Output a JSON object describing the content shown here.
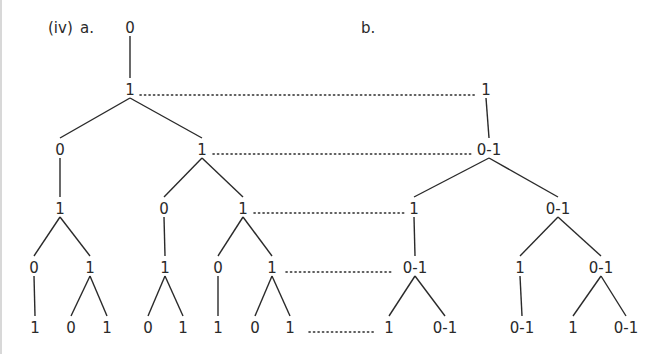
{
  "figure": {
    "label": "(iv)",
    "part_a_label": "a.",
    "part_b_label": "b."
  },
  "colors": {
    "ink": "#2a2a2a",
    "background": "#ffffff",
    "left_border": "#d8d8d8"
  },
  "tree_a": {
    "nodes": [
      {
        "id": "a0",
        "label": "0",
        "x": 130,
        "y": 28
      },
      {
        "id": "a1",
        "label": "1",
        "x": 130,
        "y": 90
      },
      {
        "id": "a2",
        "label": "0",
        "x": 60,
        "y": 150
      },
      {
        "id": "a3",
        "label": "1",
        "x": 202,
        "y": 150
      },
      {
        "id": "a4",
        "label": "1",
        "x": 60,
        "y": 209
      },
      {
        "id": "a5",
        "label": "0",
        "x": 164,
        "y": 209
      },
      {
        "id": "a6",
        "label": "1",
        "x": 243,
        "y": 209
      },
      {
        "id": "a7",
        "label": "0",
        "x": 34,
        "y": 268
      },
      {
        "id": "a8",
        "label": "1",
        "x": 90,
        "y": 268
      },
      {
        "id": "a9",
        "label": "1",
        "x": 165,
        "y": 268
      },
      {
        "id": "a10",
        "label": "0",
        "x": 218,
        "y": 268
      },
      {
        "id": "a11",
        "label": "1",
        "x": 272,
        "y": 268
      },
      {
        "id": "a12",
        "label": "1",
        "x": 35,
        "y": 328
      },
      {
        "id": "a13",
        "label": "0",
        "x": 71,
        "y": 328
      },
      {
        "id": "a14",
        "label": "1",
        "x": 107,
        "y": 328
      },
      {
        "id": "a15",
        "label": "0",
        "x": 148,
        "y": 328
      },
      {
        "id": "a16",
        "label": "1",
        "x": 183,
        "y": 328
      },
      {
        "id": "a17",
        "label": "1",
        "x": 218,
        "y": 328
      },
      {
        "id": "a18",
        "label": "0",
        "x": 255,
        "y": 328
      },
      {
        "id": "a19",
        "label": "1",
        "x": 290,
        "y": 328
      }
    ],
    "edges": [
      [
        "a0",
        "a1"
      ],
      [
        "a1",
        "a2"
      ],
      [
        "a1",
        "a3"
      ],
      [
        "a2",
        "a4"
      ],
      [
        "a3",
        "a5"
      ],
      [
        "a3",
        "a6"
      ],
      [
        "a4",
        "a7"
      ],
      [
        "a4",
        "a8"
      ],
      [
        "a5",
        "a9"
      ],
      [
        "a6",
        "a10"
      ],
      [
        "a6",
        "a11"
      ],
      [
        "a7",
        "a12"
      ],
      [
        "a8",
        "a13"
      ],
      [
        "a8",
        "a14"
      ],
      [
        "a9",
        "a15"
      ],
      [
        "a9",
        "a16"
      ],
      [
        "a10",
        "a17"
      ],
      [
        "a11",
        "a18"
      ],
      [
        "a11",
        "a19"
      ]
    ]
  },
  "tree_b": {
    "nodes": [
      {
        "id": "b0",
        "label": "1",
        "x": 486,
        "y": 90
      },
      {
        "id": "b1",
        "label": "0-1",
        "x": 489,
        "y": 150
      },
      {
        "id": "b2",
        "label": "1",
        "x": 414,
        "y": 209
      },
      {
        "id": "b3",
        "label": "0-1",
        "x": 558,
        "y": 209
      },
      {
        "id": "b4",
        "label": "0-1",
        "x": 415,
        "y": 268
      },
      {
        "id": "b5",
        "label": "1",
        "x": 520,
        "y": 268
      },
      {
        "id": "b6",
        "label": "0-1",
        "x": 601,
        "y": 268
      },
      {
        "id": "b7",
        "label": "1",
        "x": 389,
        "y": 328
      },
      {
        "id": "b8",
        "label": "0-1",
        "x": 445,
        "y": 328
      },
      {
        "id": "b9",
        "label": "0-1",
        "x": 522,
        "y": 328
      },
      {
        "id": "b10",
        "label": "1",
        "x": 573,
        "y": 328
      },
      {
        "id": "b11",
        "label": "0-1",
        "x": 626,
        "y": 328
      }
    ],
    "edges": [
      [
        "b0",
        "b1"
      ],
      [
        "b1",
        "b2"
      ],
      [
        "b1",
        "b3"
      ],
      [
        "b2",
        "b4"
      ],
      [
        "b3",
        "b5"
      ],
      [
        "b3",
        "b6"
      ],
      [
        "b4",
        "b7"
      ],
      [
        "b4",
        "b8"
      ],
      [
        "b5",
        "b9"
      ],
      [
        "b6",
        "b10"
      ],
      [
        "b6",
        "b11"
      ]
    ]
  },
  "correspondences": [
    {
      "from": "a1",
      "to": "b0",
      "x1": 140,
      "x2": 477,
      "y": 95
    },
    {
      "from": "a3",
      "to": "b1",
      "x1": 213,
      "x2": 474,
      "y": 154
    },
    {
      "from": "a6",
      "to": "b2",
      "x1": 254,
      "x2": 405,
      "y": 213
    },
    {
      "from": "a11",
      "to": "b4",
      "x1": 286,
      "x2": 391,
      "y": 272
    },
    {
      "from": "a19",
      "to": "b7",
      "x1": 309,
      "x2": 376,
      "y": 332
    }
  ]
}
